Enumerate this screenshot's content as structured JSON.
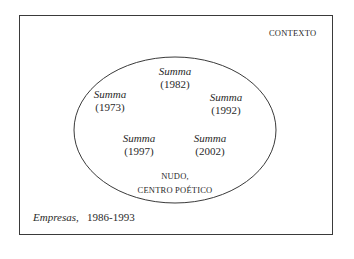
{
  "diagram": {
    "context_label": "CONTEXTO",
    "nodes": [
      {
        "title": "Summa",
        "year": "(1982)"
      },
      {
        "title": "Summa",
        "year": "(1973)"
      },
      {
        "title": "Summa",
        "year": "(1992)"
      },
      {
        "title": "Summa",
        "year": "(1997)"
      },
      {
        "title": "Summa",
        "year": "(2002)"
      }
    ],
    "core_label_line1": "NUDO,",
    "core_label_line2": "CENTRO POÉTICO",
    "caption": {
      "title": "Empresas,",
      "years": "1986-1993"
    },
    "colors": {
      "stroke": "#3a3a3a",
      "text": "#2a2a2a",
      "background": "#ffffff"
    }
  }
}
